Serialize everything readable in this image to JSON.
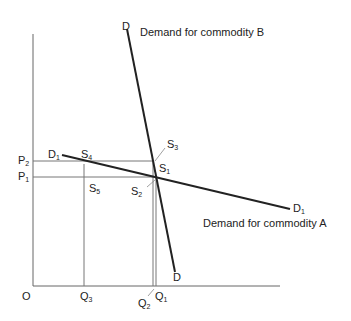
{
  "diagram": {
    "title_b": "Demand for commodity B",
    "title_a": "Demand for commodity A",
    "origin": "O",
    "curves": {
      "b_top": {
        "main": "D",
        "sub": ""
      },
      "b_bottom": {
        "main": "D",
        "sub": ""
      },
      "a_left": {
        "main": "D",
        "sub": "1"
      },
      "a_right": {
        "main": "D",
        "sub": "1"
      }
    },
    "prices": [
      {
        "main": "P",
        "sub": "2"
      },
      {
        "main": "P",
        "sub": "1"
      }
    ],
    "quantities": [
      {
        "main": "Q",
        "sub": "3"
      },
      {
        "main": "Q",
        "sub": "2"
      },
      {
        "main": "Q",
        "sub": "1"
      }
    ],
    "points": [
      {
        "main": "S",
        "sub": "1"
      },
      {
        "main": "S",
        "sub": "2"
      },
      {
        "main": "S",
        "sub": "3"
      },
      {
        "main": "S",
        "sub": "4"
      },
      {
        "main": "S",
        "sub": "5"
      }
    ]
  }
}
